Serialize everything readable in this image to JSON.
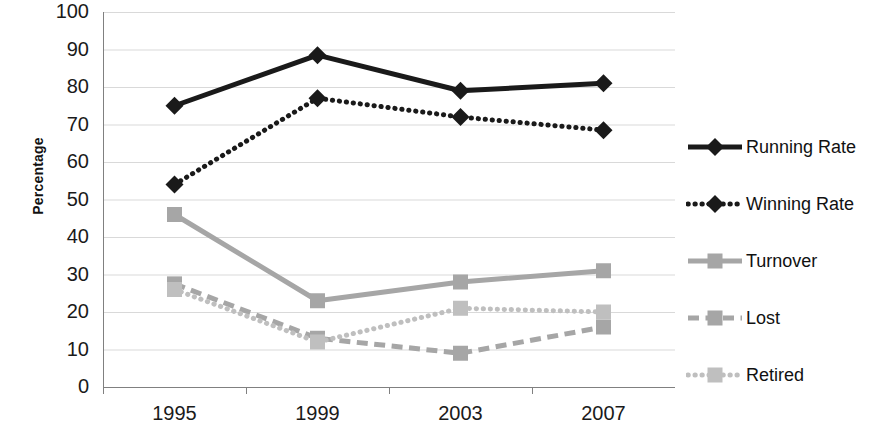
{
  "chart_data": {
    "type": "line",
    "title": "",
    "xlabel": "",
    "ylabel": "Percentage",
    "categories": [
      "1995",
      "1999",
      "2003",
      "2007"
    ],
    "ylim": [
      0,
      100
    ],
    "ytick_step": 10,
    "yticks": [
      "100",
      "90",
      "80",
      "70",
      "60",
      "50",
      "40",
      "30",
      "20",
      "10",
      "0"
    ],
    "grid": true,
    "legend_position": "right",
    "series": [
      {
        "name": "Running Rate",
        "values": [
          75,
          88.5,
          79,
          81
        ],
        "color": "#1a1a1a",
        "style": "solid",
        "marker": "diamond"
      },
      {
        "name": "Winning Rate",
        "values": [
          54,
          77,
          72,
          68.5
        ],
        "color": "#1a1a1a",
        "style": "dotted",
        "marker": "diamond"
      },
      {
        "name": "Turnover",
        "values": [
          46,
          23,
          28,
          31
        ],
        "color": "#a6a6a6",
        "style": "solid",
        "marker": "square"
      },
      {
        "name": "Lost",
        "values": [
          27.5,
          13,
          9,
          16
        ],
        "color": "#a6a6a6",
        "style": "dashed",
        "marker": "square"
      },
      {
        "name": "Retired",
        "values": [
          26,
          12,
          21,
          20
        ],
        "color": "#bfbfbf",
        "style": "dotted",
        "marker": "square"
      }
    ]
  }
}
